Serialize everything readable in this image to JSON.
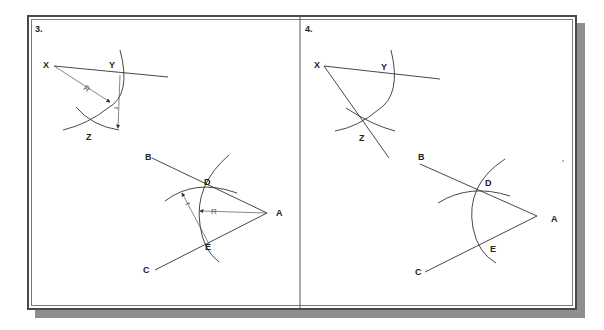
{
  "figure": {
    "panels": [
      {
        "number": "3.",
        "points": {
          "X": "X",
          "Y": "Y",
          "Z": "Z",
          "A": "A",
          "B": "B",
          "C": "C",
          "D": "D",
          "E": "E"
        },
        "dimensions": {
          "R": "R",
          "r": "r"
        }
      },
      {
        "number": "4.",
        "points": {
          "X": "X",
          "Y": "Y",
          "Z": "Z",
          "A": "A",
          "B": "B",
          "C": "C",
          "D": "D",
          "E": "E"
        }
      }
    ],
    "colors": {
      "line": "#333333",
      "frame": "#4a4a4a",
      "shadow": "#8e8e8e"
    }
  }
}
